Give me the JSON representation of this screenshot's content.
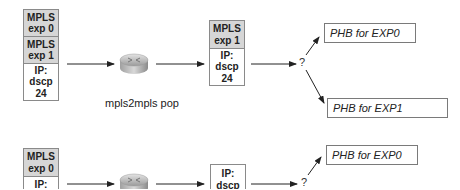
{
  "diagram": {
    "top": {
      "ingress_stack": [
        {
          "line1": "MPLS",
          "line2": "exp 0"
        },
        {
          "line1": "MPLS",
          "line2": "exp 1"
        },
        {
          "line1": "IP:",
          "line2": "dscp",
          "line3": "24"
        }
      ],
      "router_label": "mpls2mpls pop",
      "egress_stack": [
        {
          "line1": "MPLS",
          "line2": "exp 1"
        },
        {
          "line1": "IP:",
          "line2": "dscp",
          "line3": "24"
        }
      ],
      "decision": "?",
      "phb_options": [
        "PHB for EXP0",
        "PHB for EXP1"
      ]
    },
    "bottom": {
      "ingress_stack": [
        {
          "line1": "MPLS",
          "line2": "exp 0"
        },
        {
          "line1": "IP:"
        }
      ],
      "egress_stack": [
        {
          "line1": "IP:",
          "line2": "dscp"
        }
      ],
      "decision": "?",
      "phb_options": [
        "PHB for EXP0"
      ]
    }
  },
  "colors": {
    "mpls_fill": "#d6d6d6",
    "border": "#8a8a8a",
    "line": "#222222"
  }
}
